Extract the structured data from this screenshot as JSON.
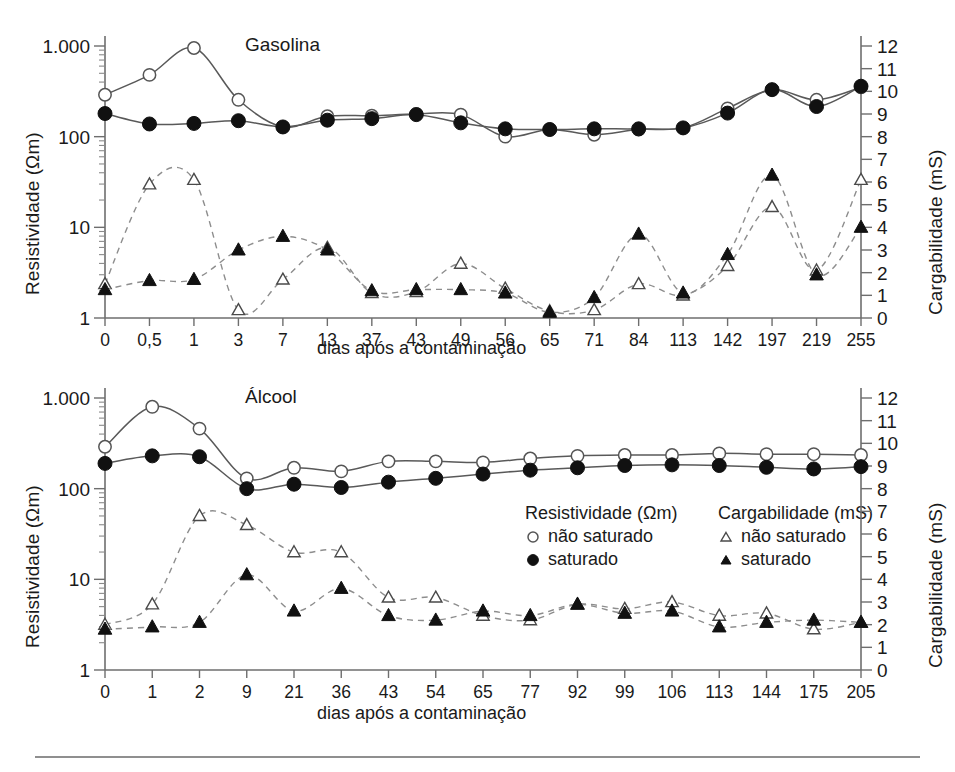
{
  "figure": {
    "axis_titles": {
      "y_left": "Resistividade (Ωm)",
      "y_right": "Cargabilidade (mS)",
      "x": "dias após a contaminação"
    },
    "y_left_ticks": [
      "1",
      "10",
      "100",
      "1.000"
    ],
    "y_right_ticks": [
      "0",
      "1",
      "2",
      "3",
      "4",
      "5",
      "6",
      "7",
      "8",
      "9",
      "10",
      "11",
      "12"
    ]
  },
  "legend": {
    "resistivity": {
      "title": "Resistividade (Ωm)",
      "items": [
        {
          "label": "não saturado",
          "marker": "open-circle-icon"
        },
        {
          "label": "saturado",
          "marker": "filled-circle-icon"
        }
      ]
    },
    "chargeability": {
      "title": "Cargabilidade (mS)",
      "items": [
        {
          "label": "não saturado",
          "marker": "open-triangle-icon"
        },
        {
          "label": "saturado",
          "marker": "filled-triangle-icon"
        }
      ]
    }
  },
  "chart_data": [
    {
      "type": "line",
      "title": "Gasolina",
      "xlabel": "dias após a contaminação",
      "ylabel": "Resistividade (Ωm)",
      "y2label": "Cargabilidade (mS)",
      "yscale": "log",
      "ylim": [
        1,
        1000
      ],
      "y2lim": [
        0,
        12
      ],
      "grid": false,
      "legend_position": "none",
      "categories": [
        "0",
        "0,5",
        "1",
        "3",
        "7",
        "13",
        "37",
        "43",
        "49",
        "56",
        "65",
        "71",
        "84",
        "113",
        "142",
        "197",
        "219",
        "255"
      ],
      "series": [
        {
          "name": "Resistividade não saturado",
          "axis": "left",
          "marker": "open-circle",
          "line": "solid",
          "values": [
            290,
            480,
            950,
            255,
            128,
            168,
            170,
            178,
            175,
            100,
            120,
            105,
            120,
            125,
            205,
            330,
            255,
            350
          ]
        },
        {
          "name": "Resistividade saturado",
          "axis": "left",
          "marker": "filled-circle",
          "line": "solid",
          "values": [
            180,
            138,
            140,
            150,
            128,
            152,
            158,
            175,
            142,
            122,
            120,
            122,
            122,
            125,
            182,
            330,
            215,
            360
          ]
        },
        {
          "name": "Cargabilidade não saturado",
          "axis": "right",
          "marker": "open-triangle",
          "line": "dashed",
          "values": [
            1.5,
            5.9,
            6.1,
            0.35,
            1.7,
            3.1,
            1.1,
            1.15,
            2.4,
            1.3,
            0.3,
            0.35,
            1.5,
            1.0,
            2.3,
            4.9,
            2.1,
            6.1
          ]
        },
        {
          "name": "Cargabilidade saturado",
          "axis": "right",
          "marker": "filled-triangle",
          "line": "dashed",
          "values": [
            1.25,
            1.65,
            1.7,
            3.0,
            3.6,
            3.0,
            1.2,
            1.25,
            1.25,
            1.1,
            0.25,
            0.9,
            3.7,
            1.1,
            2.8,
            6.3,
            1.9,
            4.0
          ]
        }
      ]
    },
    {
      "type": "line",
      "title": "Álcool",
      "xlabel": "dias após a contaminação",
      "ylabel": "Resistividade (Ωm)",
      "y2label": "Cargabilidade (mS)",
      "yscale": "log",
      "ylim": [
        1,
        1000
      ],
      "y2lim": [
        0,
        12
      ],
      "grid": false,
      "legend_position": "inside-right",
      "categories": [
        "0",
        "1",
        "2",
        "9",
        "21",
        "36",
        "43",
        "54",
        "65",
        "77",
        "92",
        "99",
        "106",
        "113",
        "144",
        "175",
        "205"
      ],
      "series": [
        {
          "name": "Resistividade não saturado",
          "axis": "left",
          "marker": "open-circle",
          "line": "solid",
          "values": [
            290,
            800,
            460,
            130,
            170,
            155,
            200,
            200,
            195,
            215,
            230,
            235,
            235,
            245,
            240,
            240,
            235
          ]
        },
        {
          "name": "Resistividade saturado",
          "axis": "left",
          "marker": "filled-circle",
          "line": "solid",
          "values": [
            190,
            230,
            225,
            100,
            112,
            103,
            118,
            130,
            145,
            160,
            170,
            180,
            183,
            180,
            172,
            165,
            175
          ]
        },
        {
          "name": "Cargabilidade não saturado",
          "axis": "right",
          "marker": "open-triangle",
          "line": "dashed",
          "values": [
            2.0,
            2.9,
            6.8,
            6.4,
            5.2,
            5.2,
            3.2,
            3.2,
            2.4,
            2.2,
            2.9,
            2.7,
            3.0,
            2.4,
            2.5,
            1.8,
            2.1
          ]
        },
        {
          "name": "Cargabilidade saturado",
          "axis": "right",
          "marker": "filled-triangle",
          "line": "dashed",
          "values": [
            1.8,
            1.9,
            2.1,
            4.2,
            2.6,
            3.6,
            2.4,
            2.2,
            2.6,
            2.4,
            2.9,
            2.5,
            2.6,
            1.9,
            2.1,
            2.2,
            2.1
          ]
        }
      ]
    }
  ]
}
